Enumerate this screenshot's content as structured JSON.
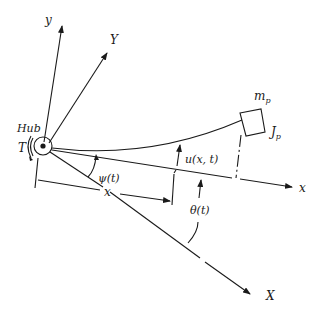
{
  "diagram": {
    "labels": {
      "y_axis": "y",
      "Y_axis": "Y",
      "x_axis": "x",
      "X_axis": "X",
      "hub": "Hub",
      "torque": "T",
      "psi": "ψ(t)",
      "deflection": "u(x, t)",
      "position": "x",
      "theta": "θ(t)",
      "mass_main": "m",
      "mass_sub": "p",
      "inertia_main": "J",
      "inertia_sub": "p"
    },
    "colors": {
      "ink": "#1a1a1a",
      "background": "#ffffff"
    }
  }
}
